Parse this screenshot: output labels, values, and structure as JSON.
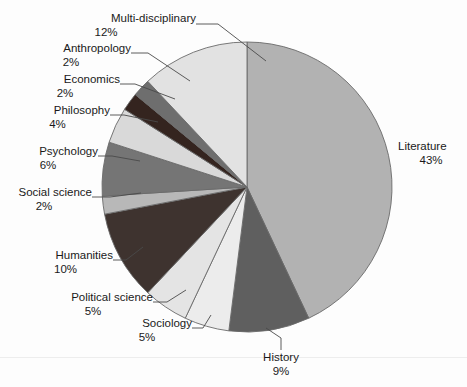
{
  "chart_data": {
    "type": "pie",
    "title": "",
    "subtitle": "",
    "xlabel": "",
    "ylabel": "",
    "legend_position": "none",
    "grid": false,
    "labels_show_percent": true,
    "start_angle_deg": 0,
    "direction": "clockwise",
    "categories": [
      "Literature",
      "History",
      "Sociology",
      "Political science",
      "Humanities",
      "Social science",
      "Psychology",
      "Philosophy",
      "Economics",
      "Anthropology",
      "Multi-disciplinary"
    ],
    "values": [
      43,
      9,
      5,
      5,
      10,
      2,
      6,
      4,
      2,
      2,
      12
    ],
    "units": "percent",
    "total": 100,
    "slices": [
      {
        "label": "Literature",
        "percent": 12,
        "percent_text": "43%",
        "value": 43,
        "color": "#b2b2b2"
      },
      {
        "label": "History",
        "percent_text": "9%",
        "value": 9,
        "color": "#5f5f5f"
      },
      {
        "label": "Sociology",
        "percent_text": "5%",
        "value": 5,
        "color": "#ececec"
      },
      {
        "label": "Political science",
        "percent_text": "5%",
        "value": 5,
        "color": "#e4e4e4"
      },
      {
        "label": "Humanities",
        "percent_text": "10%",
        "value": 10,
        "color": "#3e332f"
      },
      {
        "label": "Social science",
        "percent_text": "2%",
        "value": 2,
        "color": "#b8b8b8"
      },
      {
        "label": "Psychology",
        "percent_text": "6%",
        "value": 6,
        "color": "#757575"
      },
      {
        "label": "Philosophy",
        "percent_text": "4%",
        "value": 4,
        "color": "#d9d9d9"
      },
      {
        "label": "Economics",
        "percent_text": "2%",
        "value": 2,
        "color": "#34241f"
      },
      {
        "label": "Anthropology",
        "percent_text": "2%",
        "value": 2,
        "color": "#6e6e6e"
      },
      {
        "label": "Multi-disciplinary",
        "percent_text": "12%",
        "value": 12,
        "color": "#e2e2e2"
      }
    ]
  },
  "labels": {
    "multi_disciplinary": {
      "name": "Multi-disciplinary",
      "pct": "12%"
    },
    "anthropology": {
      "name": "Anthropology",
      "pct": "2%"
    },
    "economics": {
      "name": "Economics",
      "pct": "2%"
    },
    "philosophy": {
      "name": "Philosophy",
      "pct": "4%"
    },
    "psychology": {
      "name": "Psychology",
      "pct": "6%"
    },
    "social_science": {
      "name": "Social science",
      "pct": "2%"
    },
    "humanities": {
      "name": "Humanities",
      "pct": "10%"
    },
    "political_science": {
      "name": "Political science",
      "pct": "5%"
    },
    "sociology": {
      "name": "Sociology",
      "pct": "5%"
    },
    "history": {
      "name": "History",
      "pct": "9%"
    },
    "literature": {
      "name": "Literature",
      "pct": "43%"
    }
  },
  "style": {
    "background": "#fdfdfd",
    "slice_outline": "#6a6a6a",
    "leader_line": "#4a4a4a",
    "text_color": "#1a1a1a"
  }
}
